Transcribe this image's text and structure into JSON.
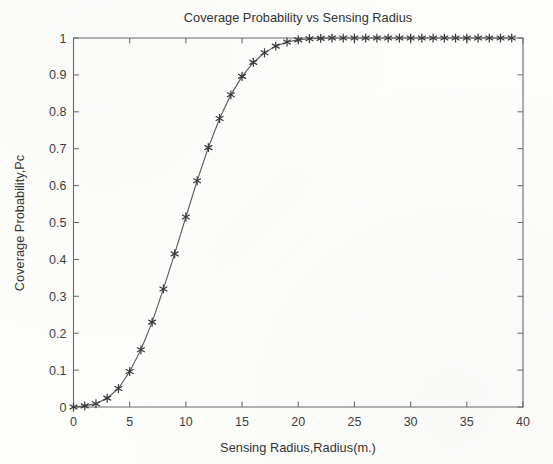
{
  "figure": {
    "background_color": "#fdfdfc",
    "line_color": "#5d5d5d",
    "marker_color": "#3a3a3a",
    "axis_color": "#6b6b6b",
    "text_color": "#333333"
  },
  "chart_data": {
    "type": "line",
    "title": "Coverage Probability vs Sensing Radius",
    "xlabel": "Sensing Radius,Radius(m.)",
    "ylabel": "Coverage Probability,Pc",
    "xlim": [
      0,
      40
    ],
    "ylim": [
      0,
      1
    ],
    "xticks": [
      0,
      5,
      10,
      15,
      20,
      25,
      30,
      35,
      40
    ],
    "xticklabels": [
      "0",
      "5",
      "10",
      "15",
      "20",
      "25",
      "30",
      "35",
      "40"
    ],
    "yticks": [
      0,
      0.1,
      0.2,
      0.3,
      0.4,
      0.5,
      0.6,
      0.7,
      0.8,
      0.9,
      1
    ],
    "yticklabels": [
      "0",
      "0.1",
      "0.2",
      "0.3",
      "0.4",
      "0.5",
      "0.6",
      "0.7",
      "0.8",
      "0.9",
      "1"
    ],
    "grid": false,
    "legend": null,
    "marker": "asterisk",
    "series": [
      {
        "name": "Coverage Probability",
        "x": [
          0,
          1,
          2,
          3,
          4,
          5,
          6,
          7,
          8,
          9,
          10,
          11,
          12,
          13,
          14,
          15,
          16,
          17,
          18,
          19,
          20,
          21,
          22,
          23,
          24,
          25,
          26,
          27,
          28,
          29,
          30,
          31,
          32,
          33,
          34,
          35,
          36,
          37,
          38,
          39
        ],
        "values": [
          0.0,
          0.003,
          0.009,
          0.024,
          0.05,
          0.096,
          0.155,
          0.23,
          0.32,
          0.415,
          0.515,
          0.613,
          0.703,
          0.782,
          0.846,
          0.896,
          0.934,
          0.96,
          0.978,
          0.989,
          0.995,
          0.998,
          0.999,
          1.0,
          1.0,
          1.0,
          1.0,
          1.0,
          1.0,
          1.0,
          1.0,
          1.0,
          1.0,
          1.0,
          1.0,
          1.0,
          1.0,
          1.0,
          1.0,
          1.0
        ]
      }
    ]
  }
}
